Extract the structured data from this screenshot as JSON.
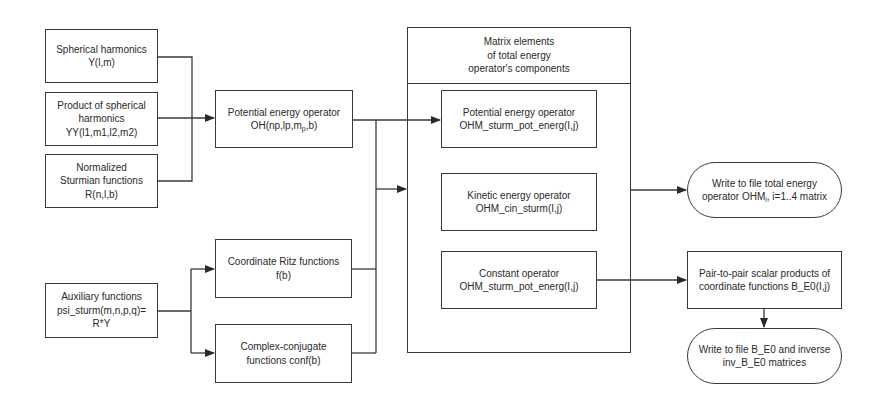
{
  "diagram": {
    "nodes": {
      "spherical_harmonics": {
        "lines": [
          "Spherical harmonics",
          "Y(l,m)"
        ]
      },
      "product_spherical": {
        "lines": [
          "Product of spherical",
          "harmonics",
          "YY(l1,m1,l2,m2)"
        ]
      },
      "normalized_sturmian": {
        "lines": [
          "Normalized",
          "Sturmian functions",
          "R(n,l,b)"
        ]
      },
      "auxiliary_functions": {
        "lines": [
          "Auxiliary functions",
          "psi_sturm(m,n,p,q)=",
          "R*Y"
        ]
      },
      "potential_energy_operator": {
        "line1": "Potential energy operator",
        "line2_pre": "OH(np,lp,m",
        "line2_sub": "p",
        "line2_post": ",b)"
      },
      "coordinate_ritz": {
        "lines": [
          "Coordinate Ritz functions",
          "f(b)"
        ]
      },
      "complex_conjugate": {
        "lines": [
          "Complex-conjugate",
          "functions conf(b)"
        ]
      },
      "matrix_elements_group": {
        "header": [
          "Matrix elements",
          "of total energy",
          "operator's components"
        ],
        "items": [
          {
            "lines": [
              "Potential energy operator",
              "OHM_sturm_pot_energ(I,j)"
            ]
          },
          {
            "lines": [
              "Kinetic energy operator",
              "OHM_cin_sturm(I,j)"
            ]
          },
          {
            "lines": [
              "Constant operator",
              "OHM_sturm_pot_energ(I,j)"
            ]
          }
        ]
      },
      "write_total_energy": {
        "line1": "Write to file total energy",
        "line2_pre": "operator OHM",
        "line2_sub": "i",
        "line2_post": ", i=1..4 matrix"
      },
      "pair_scalar_products": {
        "lines": [
          "Pair-to-pair scalar products of",
          "coordinate functions B_E0(I,j)"
        ]
      },
      "write_b_e0": {
        "lines": [
          "Write to file B_E0 and inverse",
          "inv_B_E0 matrices"
        ]
      }
    },
    "colors": {
      "line": "#3a3a3a",
      "text": "#2a2a2a",
      "background": "#ffffff"
    }
  }
}
